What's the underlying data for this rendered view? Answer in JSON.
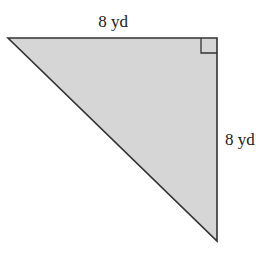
{
  "figure": {
    "shape": "right-triangle",
    "fill_color": "#d6d6d6",
    "stroke_color": "#333333",
    "labels": {
      "top_side": "8 yd",
      "right_side": "8 yd"
    },
    "right_angle_marker": true
  }
}
